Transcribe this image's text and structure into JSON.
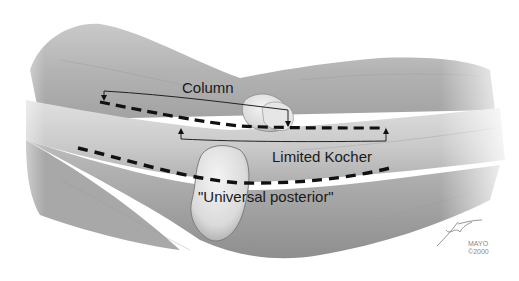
{
  "figure": {
    "colors": {
      "background": "#ffffff",
      "skin_light": "#d9d9d9",
      "skin_mid": "#b8b8b8",
      "skin_dark": "#8c8c8c",
      "incision_line": "#111111",
      "label_text": "#1a1a1a",
      "credit_text": "#8a8a8a"
    }
  },
  "labels": {
    "column": "Column",
    "limited_kocher": "Limited Kocher",
    "universal_posterior": "\"Universal posterior\""
  },
  "incisions": [
    {
      "name": "Column",
      "style": "dashed",
      "bracket": "upper"
    },
    {
      "name": "Limited Kocher",
      "style": "dashed",
      "bracket": "lower"
    },
    {
      "name": "Universal posterior",
      "style": "dashed",
      "bracket": "none"
    }
  ],
  "credit": {
    "signature": "artist signature",
    "line1": "MAYO",
    "line2": "©2000"
  }
}
